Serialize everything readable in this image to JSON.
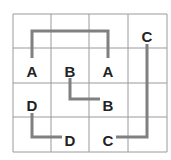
{
  "puzzle": {
    "type": "number-link grid",
    "rows": 4,
    "cols": 4,
    "grid": {
      "x": [
        13,
        51,
        89,
        128,
        167
      ],
      "y": [
        14,
        48,
        83,
        117,
        152
      ],
      "line_color": "#9a9a9a"
    },
    "path_color": "#808080",
    "labels": [
      {
        "letter": "A",
        "row": 1,
        "col": 0,
        "x": 32,
        "y": 72
      },
      {
        "letter": "B",
        "row": 1,
        "col": 1,
        "x": 70,
        "y": 72
      },
      {
        "letter": "A",
        "row": 1,
        "col": 2,
        "x": 108,
        "y": 72
      },
      {
        "letter": "C",
        "row": 0,
        "col": 3,
        "x": 147,
        "y": 37
      },
      {
        "letter": "D",
        "row": 2,
        "col": 0,
        "x": 32,
        "y": 106
      },
      {
        "letter": "B",
        "row": 2,
        "col": 2,
        "x": 108,
        "y": 106
      },
      {
        "letter": "D",
        "row": 3,
        "col": 1,
        "x": 70,
        "y": 141
      },
      {
        "letter": "C",
        "row": 3,
        "col": 2,
        "x": 108,
        "y": 141
      }
    ],
    "paths": [
      {
        "name": "A",
        "points": "32,58 32,31 108,31 108,58"
      },
      {
        "name": "B",
        "points": "70,78 70,99 100,99"
      },
      {
        "name": "C",
        "points": "147,44 147,137 116,137"
      },
      {
        "name": "D",
        "points": "32,113 32,137 62,137"
      }
    ]
  }
}
